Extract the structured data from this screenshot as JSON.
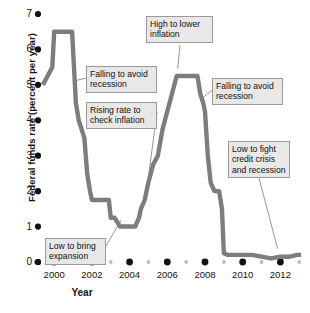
{
  "chart_data": {
    "type": "line",
    "title": "",
    "xlabel": "Year",
    "ylabel": "Federal funds rate (percent per year)",
    "xlim": [
      1999.3,
      2013.2
    ],
    "ylim": [
      0,
      7
    ],
    "grid": false,
    "legend_position": "none",
    "y_ticks": [
      "7",
      "6",
      "5",
      "4",
      "3",
      "2",
      "1",
      "0"
    ],
    "y_tick_values": [
      7,
      6,
      5,
      4,
      3,
      2,
      1,
      0
    ],
    "x_ticks": [
      "2000",
      "2002",
      "2004",
      "2006",
      "2008",
      "2010",
      "2012"
    ],
    "x_tick_values": [
      2000,
      2002,
      2004,
      2006,
      2008,
      2010,
      2012
    ],
    "x_minor_values": [
      1999,
      2001,
      2003,
      2005,
      2007,
      2009,
      2011,
      2013
    ],
    "series": [
      {
        "name": "Federal funds rate",
        "color": "#7d7d7d",
        "x": [
          1999.4,
          1999.7,
          1999.9,
          2000.0,
          2000.1,
          2000.25,
          2000.4,
          2000.6,
          2000.8,
          2000.95,
          2001.05,
          2001.15,
          2001.3,
          2001.45,
          2001.6,
          2001.75,
          2001.9,
          2002.0,
          2002.3,
          2002.6,
          2002.9,
          2003.0,
          2003.2,
          2003.5,
          2003.8,
          2004.0,
          2004.3,
          2004.5,
          2004.6,
          2004.8,
          2005.0,
          2005.25,
          2005.5,
          2005.75,
          2006.0,
          2006.25,
          2006.5,
          2006.7,
          2007.0,
          2007.3,
          2007.6,
          2007.75,
          2007.9,
          2008.0,
          2008.15,
          2008.3,
          2008.5,
          2008.75,
          2008.9,
          2009.0,
          2009.2,
          2009.5,
          2010.0,
          2010.5,
          2011.0,
          2011.5,
          2012.0,
          2012.5,
          2012.9,
          2013.1
        ],
        "y": [
          5.0,
          5.3,
          5.5,
          6.5,
          6.5,
          6.5,
          6.5,
          6.5,
          6.5,
          6.5,
          5.5,
          4.5,
          4.0,
          3.75,
          3.5,
          2.5,
          2.0,
          1.75,
          1.75,
          1.75,
          1.75,
          1.25,
          1.25,
          1.0,
          1.0,
          1.0,
          1.0,
          1.25,
          1.5,
          1.75,
          2.25,
          2.75,
          3.0,
          3.75,
          4.25,
          4.75,
          5.25,
          5.25,
          5.25,
          5.25,
          5.25,
          4.75,
          4.5,
          4.25,
          3.0,
          2.25,
          2.0,
          2.0,
          1.5,
          0.25,
          0.2,
          0.2,
          0.2,
          0.2,
          0.15,
          0.1,
          0.15,
          0.15,
          0.2,
          0.2
        ]
      }
    ],
    "annotations": [
      {
        "id": "falling-to-avoid-recession-1",
        "text": "Falling to avoid\nrecession",
        "line1": "Falling to avoid",
        "line2": "recession",
        "target_x": 2001.0,
        "target_y": 5.1
      },
      {
        "id": "rising-rate-to-check-inflation",
        "text": "Rising rate to\ncheck inflation",
        "line1": "Rising rate to",
        "line2": "check inflation",
        "target_x": 2005.0,
        "target_y": 2.4
      },
      {
        "id": "high-to-lower-inflation",
        "text": "High to lower\ninflation",
        "line1": "High to lower",
        "line2": "inflation",
        "target_x": 2006.6,
        "target_y": 5.3
      },
      {
        "id": "falling-to-avoid-recession-2",
        "text": "Falling to avoid\nrecession",
        "line1": "Falling to avoid",
        "line2": "recession",
        "target_x": 2007.9,
        "target_y": 4.5
      },
      {
        "id": "low-to-fight-credit-crisis-and-recession",
        "text": "Low to fight\ncredit crisis\nand recession",
        "line1": "Low to fight",
        "line2": "credit crisis",
        "line3": "and recession",
        "target_x": 2011.9,
        "target_y": 0.15
      },
      {
        "id": "low-to-bring-expansion",
        "text": "Low to bring\nexpansion",
        "line1": "Low to bring",
        "line2": "expansion",
        "target_x": 2003.6,
        "target_y": 1.0
      }
    ]
  },
  "axes": {
    "y_title": "Federal funds rate (percent per year)",
    "x_title": "Year",
    "y_labels": [
      "7",
      "6",
      "5",
      "4",
      "3",
      "2",
      "1",
      "0"
    ],
    "x_labels": [
      "2000",
      "2002",
      "2004",
      "2006",
      "2008",
      "2010",
      "2012"
    ]
  },
  "callouts": {
    "c1": {
      "l1": "Falling to avoid",
      "l2": "recession"
    },
    "c2": {
      "l1": "Rising rate to",
      "l2": "check inflation"
    },
    "c3": {
      "l1": "High to lower",
      "l2": "inflation"
    },
    "c4": {
      "l1": "Falling to avoid",
      "l2": "recession"
    },
    "c5": {
      "l1": "Low to fight",
      "l2": "credit crisis",
      "l3": "and recession"
    },
    "c6": {
      "l1": "Low to bring",
      "l2": "expansion"
    }
  },
  "colors": {
    "line": "#7d7d7d",
    "tick_dot": "#111111",
    "minor_dot": "#bdbdbd",
    "callout_fill": "#e8e8e8",
    "callout_border": "#9a9a9a",
    "leader": "#8a8a8a",
    "background": "#ffffff"
  }
}
